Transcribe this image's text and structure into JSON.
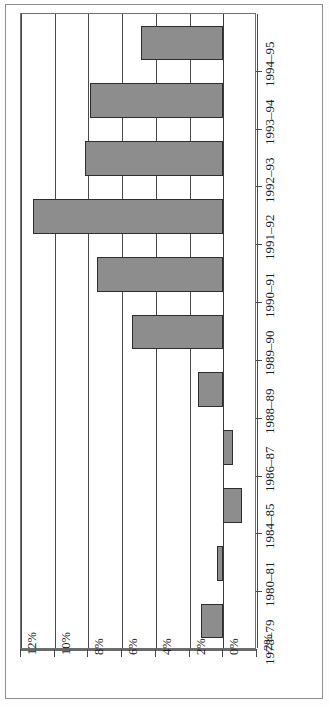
{
  "chart_data": {
    "type": "bar",
    "orientation": "horizontal-rotated",
    "title": "",
    "subtitle": "",
    "xlabel": "",
    "ylabel": "",
    "categories": [
      "1978-79",
      "1980-81",
      "1984-85",
      "1986-87",
      "1988-89",
      "1989-90",
      "1990-91",
      "1991-92",
      "1992-93",
      "1993-94",
      "1994-95"
    ],
    "values": [
      1.3,
      0.4,
      -1.1,
      -0.6,
      1.5,
      5.4,
      7.5,
      11.3,
      8.2,
      7.9,
      4.9
    ],
    "value_suffix": "%",
    "axis_ticks": [
      "12%",
      "10%",
      "8%",
      "6%",
      "4%",
      "2%",
      "0%",
      "-2%"
    ],
    "axis_tick_values": [
      12,
      10,
      8,
      6,
      4,
      2,
      0,
      -2
    ],
    "xlim": [
      -2,
      12
    ],
    "grid": true,
    "legend": null,
    "bar_fill": "#8d8d8d",
    "bar_border": "#2e2e2e",
    "gridline_color": "#4a4a4a",
    "plot_border": "#6f6f6f",
    "frame_border": "#8d8d8d",
    "background": "#ffffff"
  }
}
